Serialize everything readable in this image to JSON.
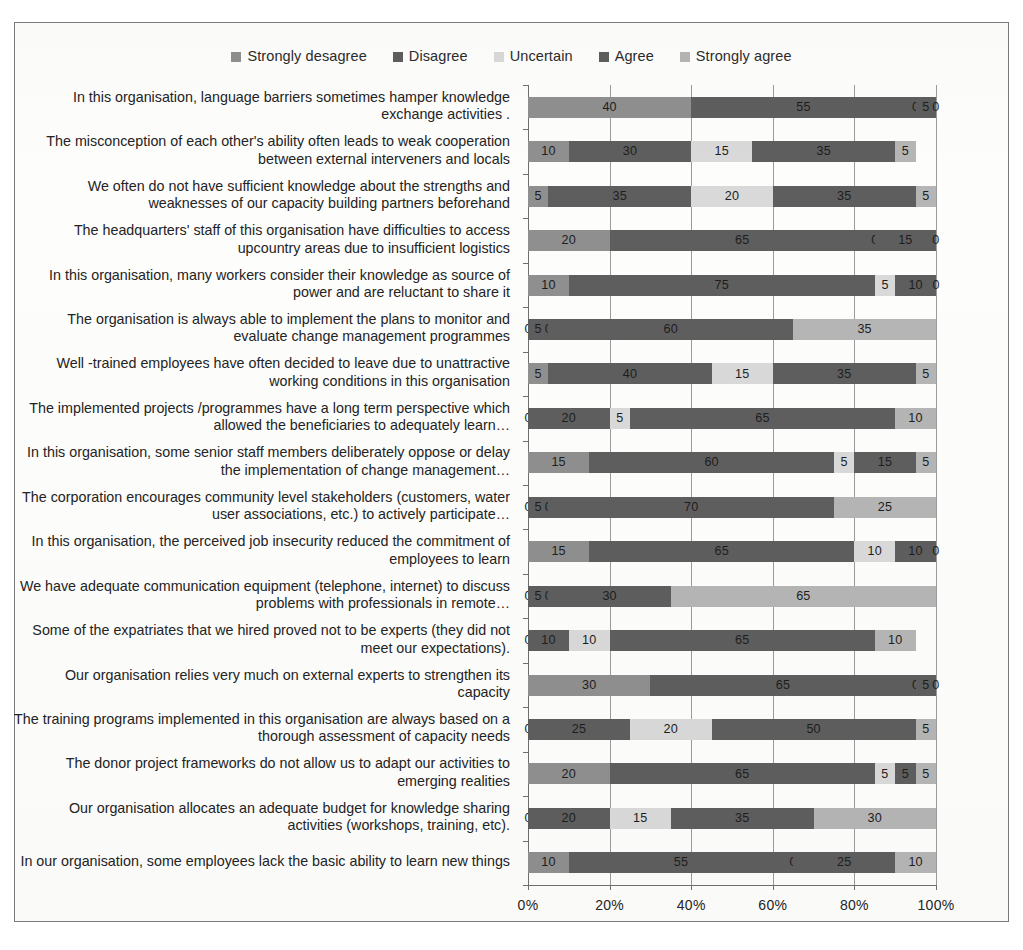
{
  "legend": {
    "position": "top",
    "items": [
      {
        "label": "Strongly desagree",
        "color": "#8f8f8f"
      },
      {
        "label": "Disagree",
        "color": "#5e5e5e"
      },
      {
        "label": "Uncertain",
        "color": "#d9d9d9"
      },
      {
        "label": "Agree",
        "color": "#5e5e5e"
      },
      {
        "label": "Strongly agree",
        "color": "#b5b5b5"
      }
    ]
  },
  "axis": {
    "x_ticks": [
      "0%",
      "20%",
      "40%",
      "60%",
      "80%",
      "100%"
    ],
    "x_values": [
      0,
      20,
      40,
      60,
      80,
      100
    ]
  },
  "chart_data": {
    "type": "bar",
    "orientation": "horizontal",
    "stacked": true,
    "stack_mode": "percent",
    "title": "",
    "xlabel": "",
    "ylabel": "",
    "xlim": [
      0,
      100
    ],
    "grid": true,
    "legend_position": "top",
    "tick_labels": [
      "0%",
      "20%",
      "40%",
      "60%",
      "80%",
      "100%"
    ],
    "categories": [
      "In this organisation, language barriers sometimes hamper knowledge exchange activities .",
      "The misconception of each  other's ability often leads to  weak cooperation between external interveners and locals",
      "We often do not have sufficient knowledge about the strengths and weaknesses of our capacity building partners beforehand",
      "The headquarters' staff of this organisation have difficulties to access upcountry areas due to insufficient logistics",
      "In this organisation, many workers consider their knowledge as source of power and are reluctant to share it",
      "The organisation is always able to implement the plans to monitor and evaluate change management programmes",
      "Well -trained employees have often decided to leave due to unattractive working conditions in this organisation",
      "The implemented projects /programmes have a long term perspective which allowed the beneficiaries to adequately learn…",
      "In this organisation, some senior staff members deliberately oppose or delay the implementation of change management…",
      "The corporation encourages community level stakeholders (customers, water user associations, etc.) to actively participate…",
      "In this organisation, the perceived job insecurity reduced the commitment of employees to learn",
      "We have adequate communication equipment (telephone, internet) to discuss problems with professionals in remote…",
      "Some of the expatriates that we hired proved not to be experts (they did not meet our expectations).",
      "Our organisation relies very much on external experts to strengthen its capacity",
      "The training programs implemented in this organisation are always based on a thorough assessment of capacity needs",
      "The donor project frameworks do not allow us to adapt our activities to emerging realities",
      "Our organisation allocates an adequate budget for knowledge sharing activities (workshops, training, etc).",
      "In our organisation, some employees lack the basic ability to learn new things"
    ],
    "series": [
      {
        "name": "Strongly desagree",
        "color": "#8f8f8f",
        "values": [
          40,
          10,
          5,
          20,
          10,
          0,
          5,
          0,
          15,
          0,
          15,
          0,
          0,
          30,
          0,
          20,
          0,
          10
        ]
      },
      {
        "name": "Disagree",
        "color": "#5e5e5e",
        "values": [
          55,
          30,
          35,
          65,
          75,
          5,
          40,
          20,
          60,
          5,
          65,
          5,
          10,
          65,
          25,
          65,
          20,
          55
        ]
      },
      {
        "name": "Uncertain",
        "color": "#d9d9d9",
        "values": [
          0,
          15,
          20,
          0,
          5,
          0,
          15,
          5,
          5,
          0,
          10,
          0,
          10,
          0,
          20,
          5,
          15,
          0
        ]
      },
      {
        "name": "Agree",
        "color": "#5e5e5e",
        "values": [
          5,
          35,
          35,
          15,
          10,
          60,
          35,
          65,
          15,
          70,
          10,
          30,
          65,
          5,
          50,
          5,
          35,
          25
        ]
      },
      {
        "name": "Strongly agree",
        "color": "#b5b5b5",
        "values": [
          0,
          5,
          5,
          0,
          0,
          35,
          5,
          10,
          5,
          25,
          0,
          65,
          10,
          0,
          5,
          5,
          30,
          10
        ]
      }
    ]
  }
}
